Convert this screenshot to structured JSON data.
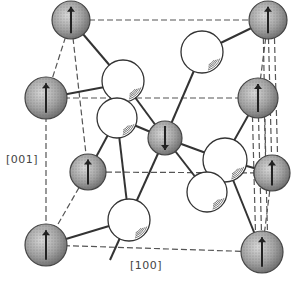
{
  "figure": {
    "type": "crystal-structure",
    "labels": {
      "axis_vertical": "[001]",
      "axis_horizontal": "[100]"
    },
    "colors": {
      "line": "#333333",
      "dashed": "#555555",
      "shaded_fill": "#9a9a9a",
      "white_fill": "#ffffff",
      "arrow": "#222222"
    },
    "magnetic_atoms": [
      {
        "id": "m1",
        "x": 71,
        "y": 20,
        "r": 19,
        "spin": "up"
      },
      {
        "id": "m2",
        "x": 46,
        "y": 98,
        "r": 21,
        "spin": "up"
      },
      {
        "id": "m3",
        "x": 268,
        "y": 20,
        "r": 19,
        "spin": "up"
      },
      {
        "id": "m4",
        "x": 258,
        "y": 98,
        "r": 20,
        "spin": "up"
      },
      {
        "id": "m5",
        "x": 88,
        "y": 172,
        "r": 18,
        "spin": "up"
      },
      {
        "id": "m6",
        "x": 272,
        "y": 173,
        "r": 18,
        "spin": "up"
      },
      {
        "id": "m7",
        "x": 46,
        "y": 245,
        "r": 21,
        "spin": "up"
      },
      {
        "id": "m8",
        "x": 262,
        "y": 252,
        "r": 21,
        "spin": "up"
      },
      {
        "id": "center",
        "x": 165,
        "y": 138,
        "r": 17,
        "spin": "down"
      }
    ],
    "white_atoms": [
      {
        "id": "w1",
        "x": 123,
        "y": 81,
        "r": 21
      },
      {
        "id": "w2",
        "x": 202,
        "y": 52,
        "r": 21
      },
      {
        "id": "w3",
        "x": 117,
        "y": 118,
        "r": 20
      },
      {
        "id": "w4",
        "x": 225,
        "y": 160,
        "r": 22
      },
      {
        "id": "w5",
        "x": 207,
        "y": 192,
        "r": 20
      },
      {
        "id": "w6",
        "x": 129,
        "y": 220,
        "r": 21
      }
    ],
    "dashed_edges": [
      [
        71,
        20,
        268,
        20
      ],
      [
        46,
        98,
        258,
        98
      ],
      [
        88,
        172,
        272,
        173
      ],
      [
        46,
        245,
        262,
        252
      ],
      [
        71,
        20,
        46,
        98
      ],
      [
        268,
        20,
        258,
        98
      ],
      [
        88,
        172,
        46,
        245
      ],
      [
        272,
        173,
        262,
        252
      ],
      [
        71,
        20,
        88,
        172
      ],
      [
        46,
        98,
        46,
        245
      ],
      [
        268,
        20,
        272,
        173
      ],
      [
        258,
        98,
        262,
        252
      ],
      [
        263,
        20,
        266,
        173
      ],
      [
        274,
        20,
        278,
        173
      ],
      [
        252,
        98,
        256,
        252
      ],
      [
        264,
        98,
        268,
        252
      ]
    ],
    "bonds": [
      [
        71,
        20,
        123,
        81
      ],
      [
        46,
        98,
        110,
        86
      ],
      [
        268,
        20,
        202,
        52
      ],
      [
        258,
        98,
        222,
        162
      ],
      [
        165,
        138,
        123,
        81
      ],
      [
        165,
        138,
        202,
        52
      ],
      [
        165,
        138,
        117,
        118
      ],
      [
        165,
        138,
        225,
        160
      ],
      [
        165,
        138,
        110,
        260
      ],
      [
        165,
        138,
        207,
        192
      ],
      [
        88,
        172,
        117,
        118
      ],
      [
        46,
        245,
        129,
        220
      ],
      [
        272,
        173,
        225,
        160
      ],
      [
        262,
        252,
        225,
        160
      ],
      [
        225,
        160,
        207,
        192
      ],
      [
        129,
        220,
        117,
        118
      ]
    ]
  }
}
